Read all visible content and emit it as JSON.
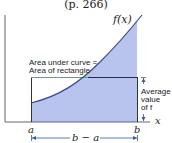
{
  "title": "(p. 266)",
  "curve_label": "f(x)",
  "annotation": {
    "line1": "Area under curve =",
    "line2": "Area of rectangle"
  },
  "average_label": {
    "line1": "Average",
    "line2": "value",
    "line3": "of f"
  },
  "axis": {
    "x_label": "x",
    "a_label": "a",
    "b_label": "b",
    "width_label": "b − a"
  },
  "colors": {
    "fill": "#b8c4ee",
    "curve": "#3a4a8a",
    "rect_top_outside": "#3fbf4f",
    "rect_edge": "#2a2a2a",
    "axis": "#555555",
    "arrow": "#3a5aa0"
  }
}
